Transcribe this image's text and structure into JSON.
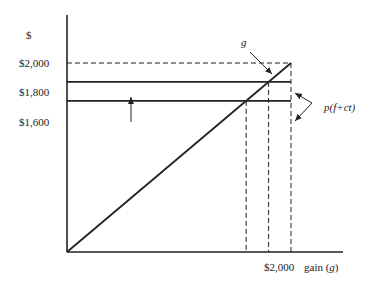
{
  "chart_data": {
    "type": "line",
    "title": "",
    "y_axis_symbol": "$",
    "y_tick_labels": [
      "$2,000",
      "$1,800",
      "$1,600"
    ],
    "y_levels": [
      2000,
      1800,
      1600
    ],
    "x_tick_label": "$2,000",
    "xlabel_prefix": "gain (",
    "xlabel_var": "g",
    "xlabel_suffix": ")",
    "ylim": [
      0,
      2150
    ],
    "xlim": [
      0,
      2350
    ],
    "series": [
      {
        "name": "g",
        "type": "line",
        "points": [
          [
            0,
            0
          ],
          [
            2000,
            2000
          ]
        ]
      },
      {
        "name": "p(f+ct) high",
        "type": "hline",
        "y": 1800,
        "x_end": 2000
      },
      {
        "name": "p(f+ct) low",
        "type": "hline",
        "y": 1600,
        "x_end": 2000
      }
    ],
    "reference_lines": [
      {
        "type": "hline-dashed",
        "y": 2000,
        "x_end": 2000
      },
      {
        "type": "vline-dashed",
        "x": 1600,
        "y_end": 1600
      },
      {
        "type": "vline-dashed",
        "x": 1800,
        "y_end": 1800
      },
      {
        "type": "vline-dashed",
        "x": 2000,
        "y_end": 2000
      }
    ],
    "annotations": {
      "g_label": "g",
      "p_label": "p(f+ct)",
      "shift_arrow": "up from 1600 to 1800"
    }
  }
}
